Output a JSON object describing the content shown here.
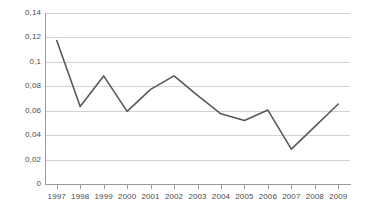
{
  "chart_data": {
    "type": "line",
    "title": "",
    "subtitle": "",
    "xlabel": "",
    "ylabel": "",
    "categories": [
      "1997",
      "1998",
      "1999",
      "2000",
      "2001",
      "2002",
      "2003",
      "2004",
      "2005",
      "2006",
      "2007",
      "2008",
      "2009"
    ],
    "values": [
      0.1175,
      0.0635,
      0.0885,
      0.0595,
      0.0775,
      0.0885,
      0.0725,
      0.0575,
      0.052,
      0.0605,
      0.0285,
      0.047,
      0.0655
    ],
    "series": [
      {
        "name": "",
        "values": [
          0.1175,
          0.0635,
          0.0885,
          0.0595,
          0.0775,
          0.0885,
          0.0725,
          0.0575,
          0.052,
          0.0605,
          0.0285,
          0.047,
          0.0655
        ]
      }
    ],
    "ylim": [
      0,
      0.14
    ],
    "ytick_values": [
      0,
      0.02,
      0.04,
      0.06,
      0.08,
      0.1,
      0.12,
      0.14
    ],
    "ytick_labels": [
      "0",
      "0,02",
      "0,04",
      "0,06",
      "0,08",
      "0,1",
      "0,12",
      "0,14"
    ],
    "xtick_labels": [
      "1997",
      "1998",
      "1999",
      "2000",
      "2001",
      "2002",
      "2003",
      "2004",
      "2005",
      "2006",
      "2007",
      "2008",
      "2009"
    ],
    "grid": true,
    "grid_axis": "y",
    "legend": false,
    "legend_position": "none",
    "markers": false,
    "decimal_separator": ",",
    "colors": {
      "line": "#595959",
      "gridline": "#d2d2d2",
      "axis": "#9a9a9a",
      "tick_text": "#4b4b4b",
      "background": "#ffffff"
    },
    "line_width": 1.6
  }
}
